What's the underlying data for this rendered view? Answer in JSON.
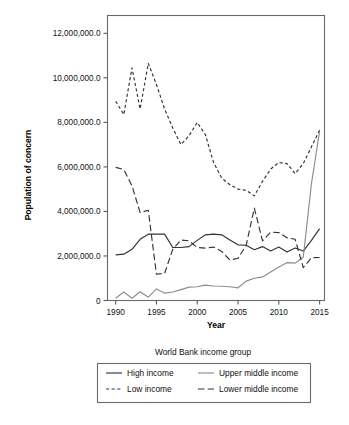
{
  "chart_data": {
    "type": "line",
    "title": "",
    "xlabel": "Year",
    "ylabel": "Population of concern",
    "xlim": [
      1989,
      2015.6
    ],
    "ylim": [
      0,
      12800000
    ],
    "grid": false,
    "legend_position": "bottom",
    "legend_title": "World Bank income group",
    "xticks": [
      1990,
      1995,
      2000,
      2005,
      2010,
      2015
    ],
    "xticklabels": [
      "1990",
      "1995",
      "2000",
      "2005",
      "2010",
      "2015"
    ],
    "yticks": [
      0,
      2000000,
      4000000,
      6000000,
      8000000,
      10000000,
      12000000
    ],
    "yticklabels": [
      "0",
      "2,000,000.0",
      "4,000,000.0",
      "6,000,000.0",
      "8,000,000.0",
      "10,000,000.0",
      "12,000,000.0"
    ],
    "x": [
      1990,
      1991,
      1992,
      1993,
      1994,
      1995,
      1996,
      1997,
      1998,
      1999,
      2000,
      2001,
      2002,
      2003,
      2004,
      2005,
      2006,
      2007,
      2008,
      2009,
      2010,
      2011,
      2012,
      2013,
      2014,
      2015
    ],
    "series": [
      {
        "name": "High income",
        "style": "solid",
        "color": "#333333",
        "values": [
          2050000,
          2080000,
          2300000,
          2750000,
          2980000,
          2980000,
          2980000,
          2380000,
          2380000,
          2420000,
          2700000,
          2950000,
          2980000,
          2950000,
          2720000,
          2500000,
          2480000,
          2280000,
          2420000,
          2220000,
          2400000,
          2180000,
          2360000,
          2220000,
          2700000,
          3230000
        ]
      },
      {
        "name": "Low income",
        "style": "dashed-short",
        "color": "#333333",
        "values": [
          8950000,
          8350000,
          10450000,
          8600000,
          10650000,
          9700000,
          8600000,
          7750000,
          7000000,
          7400000,
          8000000,
          7450000,
          6200000,
          5500000,
          5200000,
          5000000,
          4950000,
          4700000,
          5350000,
          5900000,
          6200000,
          6150000,
          5700000,
          6150000,
          6900000,
          7650000
        ]
      },
      {
        "name": "Upper middle income",
        "style": "solid",
        "color": "#8d8d8d",
        "values": [
          100000,
          380000,
          100000,
          390000,
          150000,
          520000,
          330000,
          380000,
          490000,
          600000,
          620000,
          690000,
          650000,
          640000,
          620000,
          570000,
          870000,
          1000000,
          1060000,
          1280000,
          1500000,
          1700000,
          1680000,
          1950000,
          5250000,
          7600000
        ]
      },
      {
        "name": "Lower middle income",
        "style": "dashed-long",
        "color": "#333333",
        "values": [
          5980000,
          5880000,
          5150000,
          3950000,
          4050000,
          1180000,
          1220000,
          2300000,
          2720000,
          2680000,
          2380000,
          2350000,
          2400000,
          2200000,
          1820000,
          1900000,
          2480000,
          4150000,
          2680000,
          3070000,
          3050000,
          2820000,
          2750000,
          1480000,
          1920000,
          1930000
        ]
      }
    ],
    "legend_entries": [
      {
        "label": "High income",
        "style": "solid",
        "color": "#333333"
      },
      {
        "label": "Upper middle income",
        "style": "solid",
        "color": "#8d8d8d"
      },
      {
        "label": "Low income",
        "style": "dashed-short",
        "color": "#333333"
      },
      {
        "label": "Lower middle income",
        "style": "dashed-long",
        "color": "#333333"
      }
    ]
  }
}
